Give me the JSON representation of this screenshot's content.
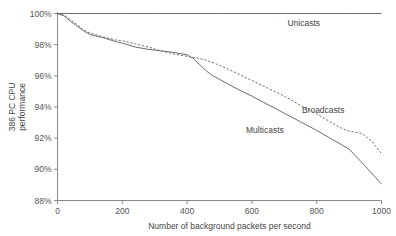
{
  "chart_data": {
    "type": "line",
    "title": "",
    "xlabel": "Number of background packets per second",
    "ylabel": "386 PC CPU performance",
    "ylabel_line1": "386 PC CPU",
    "ylabel_line2": "performance",
    "xlim": [
      0,
      1000
    ],
    "ylim": [
      88,
      100
    ],
    "grid": false,
    "legend_position": "inline-annotations",
    "xticks": [
      0,
      200,
      400,
      600,
      800,
      1000
    ],
    "xticklabels": [
      "0",
      "200",
      "400",
      "600",
      "800",
      "1000"
    ],
    "yticks": [
      88,
      90,
      92,
      94,
      96,
      98,
      100
    ],
    "yticklabels": [
      "88%",
      "90%",
      "92%",
      "94%",
      "96%",
      "98%",
      "100%"
    ],
    "series": [
      {
        "name": "Unicasts",
        "style": "solid",
        "color": "#6e6e6e",
        "label_x": 760,
        "label_y": 99.2,
        "x": [
          0,
          100,
          200,
          300,
          400,
          500,
          600,
          700,
          800,
          900,
          1000
        ],
        "y": [
          100,
          100,
          100,
          100,
          100,
          100,
          100,
          100,
          100,
          100,
          100
        ]
      },
      {
        "name": "Broadcasts",
        "style": "dashed",
        "color": "#6e6e6e",
        "label_x": 820,
        "label_y": 93.6,
        "x": [
          0,
          20,
          40,
          60,
          80,
          100,
          140,
          180,
          200,
          240,
          280,
          320,
          360,
          400,
          430,
          460,
          480,
          520,
          560,
          600,
          650,
          700,
          750,
          800,
          850,
          880,
          900,
          940,
          970,
          1000
        ],
        "y": [
          100,
          99.9,
          99.6,
          99.3,
          98.95,
          98.75,
          98.5,
          98.3,
          98.25,
          98.05,
          97.85,
          97.6,
          97.4,
          97.25,
          97.15,
          97.0,
          96.85,
          96.5,
          96.1,
          95.7,
          95.2,
          94.7,
          94.1,
          93.55,
          92.95,
          92.6,
          92.45,
          92.3,
          91.8,
          91.0
        ]
      },
      {
        "name": "Multicasts",
        "style": "solid",
        "color": "#6e6e6e",
        "label_x": 640,
        "label_y": 92.3,
        "x": [
          0,
          20,
          40,
          60,
          80,
          100,
          140,
          180,
          200,
          240,
          280,
          320,
          360,
          400,
          420,
          440,
          460,
          480,
          520,
          560,
          600,
          650,
          700,
          750,
          800,
          850,
          900,
          950,
          1000
        ],
        "y": [
          100,
          99.85,
          99.5,
          99.2,
          98.9,
          98.65,
          98.45,
          98.2,
          98.1,
          97.85,
          97.7,
          97.6,
          97.5,
          97.35,
          97.1,
          96.7,
          96.3,
          96.0,
          95.55,
          95.1,
          94.7,
          94.15,
          93.6,
          93.05,
          92.5,
          91.9,
          91.3,
          90.2,
          89.05
        ]
      }
    ]
  }
}
